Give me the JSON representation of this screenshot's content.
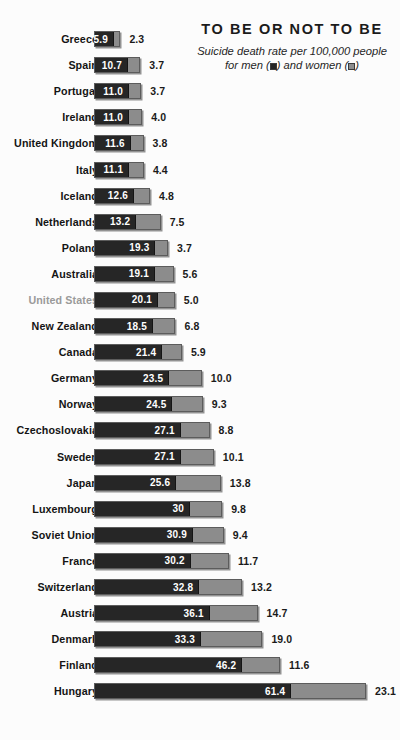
{
  "header": {
    "title": "TO BE OR NOT TO BE",
    "subtitle_line1": "Suicide death rate per 100,000 people",
    "subtitle_line2_pre": "for men (",
    "subtitle_line2_mid": ") and women (",
    "subtitle_line2_post": ")",
    "legend_men_label": "men",
    "legend_women_label": "women"
  },
  "colors": {
    "background": "#fcfcfc",
    "men_bar": "#262626",
    "women_bar": "#8c8c8c",
    "label": "#141414",
    "label_highlight": "#9a9a9a",
    "bar_border": "#5c5c5c",
    "value_text_inside": "#ffffff",
    "value_text_outside": "#1a1a1a"
  },
  "chart_data": {
    "type": "bar",
    "title": "TO BE OR NOT TO BE",
    "subtitle": "Suicide death rate per 100,000 people for men (■) and women (□)",
    "orientation": "horizontal",
    "stacked": true,
    "xlabel": "",
    "ylabel": "",
    "unit": "deaths per 100,000 people",
    "grid": false,
    "legend_position": "subtitle",
    "xlim": [
      0,
      85
    ],
    "categories": [
      "Greece",
      "Spain",
      "Portugal",
      "Ireland",
      "United Kingdom",
      "Italy",
      "Iceland",
      "Netherlands",
      "Poland",
      "Australia",
      "United States",
      "New Zealand",
      "Canada",
      "Germany",
      "Norway",
      "Czechoslovakia",
      "Sweden",
      "Japan",
      "Luxembourg",
      "Soviet Union",
      "France",
      "Switzerland",
      "Austria",
      "Denmark",
      "Finland",
      "Hungary"
    ],
    "series": [
      {
        "name": "men",
        "color": "#262626",
        "values": [
          5.9,
          10.7,
          11.0,
          11.0,
          11.6,
          11.1,
          12.6,
          13.2,
          19.3,
          19.1,
          20.1,
          18.5,
          21.4,
          23.5,
          24.5,
          27.1,
          27.1,
          25.6,
          30,
          30.9,
          30.2,
          32.8,
          36.1,
          33.3,
          46.2,
          61.4
        ]
      },
      {
        "name": "women",
        "color": "#8c8c8c",
        "values": [
          2.3,
          3.7,
          3.7,
          4.0,
          3.8,
          4.4,
          4.8,
          7.5,
          3.7,
          5.6,
          5.0,
          6.8,
          5.9,
          10.0,
          9.3,
          8.8,
          10.1,
          13.8,
          9.8,
          9.4,
          11.7,
          13.2,
          14.7,
          19.0,
          11.6,
          23.1
        ]
      }
    ]
  },
  "rows": [
    {
      "country": "Greece",
      "men": "5.9",
      "women": "2.3",
      "men_v": 5.9,
      "women_v": 2.3,
      "highlight": false
    },
    {
      "country": "Spain",
      "men": "10.7",
      "women": "3.7",
      "men_v": 10.7,
      "women_v": 3.7,
      "highlight": false
    },
    {
      "country": "Portugal",
      "men": "11.0",
      "women": "3.7",
      "men_v": 11.0,
      "women_v": 3.7,
      "highlight": false
    },
    {
      "country": "Ireland",
      "men": "11.0",
      "women": "4.0",
      "men_v": 11.0,
      "women_v": 4.0,
      "highlight": false
    },
    {
      "country": "United Kingdom",
      "men": "11.6",
      "women": "3.8",
      "men_v": 11.6,
      "women_v": 3.8,
      "highlight": false
    },
    {
      "country": "Italy",
      "men": "11.1",
      "women": "4.4",
      "men_v": 11.1,
      "women_v": 4.4,
      "highlight": false
    },
    {
      "country": "Iceland",
      "men": "12.6",
      "women": "4.8",
      "men_v": 12.6,
      "women_v": 4.8,
      "highlight": false
    },
    {
      "country": "Netherlands",
      "men": "13.2",
      "women": "7.5",
      "men_v": 13.2,
      "women_v": 7.5,
      "highlight": false
    },
    {
      "country": "Poland",
      "men": "19.3",
      "women": "3.7",
      "men_v": 19.3,
      "women_v": 3.7,
      "highlight": false
    },
    {
      "country": "Australia",
      "men": "19.1",
      "women": "5.6",
      "men_v": 19.1,
      "women_v": 5.6,
      "highlight": false
    },
    {
      "country": "United States",
      "men": "20.1",
      "women": "5.0",
      "men_v": 20.1,
      "women_v": 5.0,
      "highlight": true
    },
    {
      "country": "New Zealand",
      "men": "18.5",
      "women": "6.8",
      "men_v": 18.5,
      "women_v": 6.8,
      "highlight": false
    },
    {
      "country": "Canada",
      "men": "21.4",
      "women": "5.9",
      "men_v": 21.4,
      "women_v": 5.9,
      "highlight": false
    },
    {
      "country": "Germany",
      "men": "23.5",
      "women": "10.0",
      "men_v": 23.5,
      "women_v": 10.0,
      "highlight": false
    },
    {
      "country": "Norway",
      "men": "24.5",
      "women": "9.3",
      "men_v": 24.5,
      "women_v": 9.3,
      "highlight": false
    },
    {
      "country": "Czechoslovakia",
      "men": "27.1",
      "women": "8.8",
      "men_v": 27.1,
      "women_v": 8.8,
      "highlight": false
    },
    {
      "country": "Sweden",
      "men": "27.1",
      "women": "10.1",
      "men_v": 27.1,
      "women_v": 10.1,
      "highlight": false
    },
    {
      "country": "Japan",
      "men": "25.6",
      "women": "13.8",
      "men_v": 25.6,
      "women_v": 13.8,
      "highlight": false
    },
    {
      "country": "Luxembourg",
      "men": "30",
      "women": "9.8",
      "men_v": 30.0,
      "women_v": 9.8,
      "highlight": false
    },
    {
      "country": "Soviet Union",
      "men": "30.9",
      "women": "9.4",
      "men_v": 30.9,
      "women_v": 9.4,
      "highlight": false
    },
    {
      "country": "France",
      "men": "30.2",
      "women": "11.7",
      "men_v": 30.2,
      "women_v": 11.7,
      "highlight": false
    },
    {
      "country": "Switzerland",
      "men": "32.8",
      "women": "13.2",
      "men_v": 32.8,
      "women_v": 13.2,
      "highlight": false
    },
    {
      "country": "Austria",
      "men": "36.1",
      "women": "14.7",
      "men_v": 36.1,
      "women_v": 14.7,
      "highlight": false
    },
    {
      "country": "Denmark",
      "men": "33.3",
      "women": "19.0",
      "men_v": 33.3,
      "women_v": 19.0,
      "highlight": false
    },
    {
      "country": "Finland",
      "men": "46.2",
      "women": "11.6",
      "men_v": 46.2,
      "women_v": 11.6,
      "highlight": false
    },
    {
      "country": "Hungary",
      "men": "61.4",
      "women": "23.1",
      "men_v": 61.4,
      "women_v": 23.1,
      "highlight": false
    }
  ]
}
